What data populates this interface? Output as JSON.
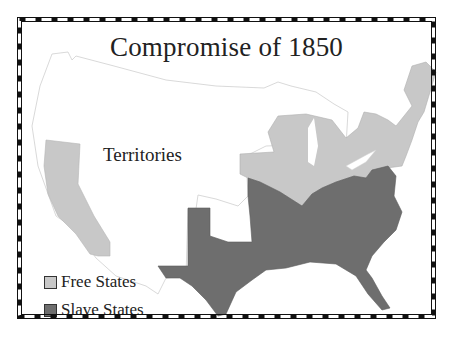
{
  "map": {
    "title": "Compromise of 1850",
    "regions": [
      {
        "name": "Territories",
        "label": "Territories",
        "color": "#ffffff"
      },
      {
        "name": "Free States",
        "color": "#c8c8c8"
      },
      {
        "name": "Slave States",
        "color": "#6e6e6e"
      }
    ],
    "legend": {
      "items": [
        {
          "label": "Free States",
          "color": "#c8c8c8"
        },
        {
          "label": "Slave States",
          "color": "#6e6e6e"
        }
      ]
    },
    "colors": {
      "free": "#c8c8c8",
      "slave": "#6e6e6e",
      "territory_outline": "#cccccc",
      "border": "#111111"
    }
  }
}
